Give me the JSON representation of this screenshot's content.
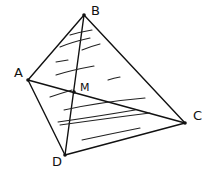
{
  "diagram": {
    "points": {
      "A": {
        "label": "A",
        "x": 28,
        "y": 80
      },
      "B": {
        "label": "B",
        "x": 84,
        "y": 15
      },
      "C": {
        "label": "C",
        "x": 185,
        "y": 123
      },
      "D": {
        "label": "D",
        "x": 65,
        "y": 155
      },
      "M": {
        "label": "M",
        "x": 74,
        "y": 92
      }
    },
    "segments": [
      [
        "A",
        "B"
      ],
      [
        "B",
        "C"
      ],
      [
        "C",
        "D"
      ],
      [
        "D",
        "A"
      ],
      [
        "A",
        "C"
      ],
      [
        "B",
        "D"
      ]
    ],
    "stroke_color": "#111111",
    "shaded_face": "BCD"
  }
}
